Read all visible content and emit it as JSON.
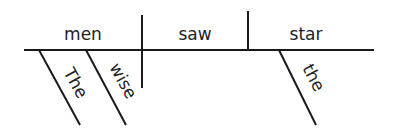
{
  "diagram": {
    "type": "sentence-diagram",
    "sentence": "The wise men saw the star",
    "subject": {
      "word": "men",
      "modifiers": [
        "The",
        "wise"
      ]
    },
    "verb": {
      "word": "saw"
    },
    "object": {
      "word": "star",
      "modifiers": [
        "the"
      ]
    },
    "colors": {
      "line": "#1a1a1a",
      "text": "#222222",
      "background": "#ffffff"
    }
  }
}
